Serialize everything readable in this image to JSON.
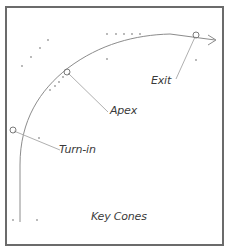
{
  "diagram": {
    "colors": {
      "border": "#6b6b6b",
      "line": "#8c8c8c",
      "leader": "#b0b0b0",
      "cone": "#9a9a9a",
      "text": "#3a3a3a"
    },
    "labels": {
      "turn_in": "Turn-in",
      "apex": "Apex",
      "exit": "Exit",
      "key_cones": "Key Cones"
    },
    "markers": [
      {
        "id": "turn_in",
        "x": 13,
        "y": 130
      },
      {
        "id": "apex",
        "x": 67,
        "y": 72
      },
      {
        "id": "exit",
        "x": 196,
        "y": 35
      }
    ],
    "cones": [
      {
        "x": 22,
        "y": 66
      },
      {
        "x": 31,
        "y": 57
      },
      {
        "x": 40,
        "y": 48
      },
      {
        "x": 48,
        "y": 40
      },
      {
        "x": 107,
        "y": 34
      },
      {
        "x": 116,
        "y": 34
      },
      {
        "x": 124,
        "y": 34
      },
      {
        "x": 132,
        "y": 34
      },
      {
        "x": 140,
        "y": 34
      },
      {
        "x": 107,
        "y": 59
      },
      {
        "x": 196,
        "y": 60
      },
      {
        "x": 50,
        "y": 90
      },
      {
        "x": 55,
        "y": 86
      },
      {
        "x": 59,
        "y": 82
      },
      {
        "x": 63,
        "y": 77
      },
      {
        "x": 39,
        "y": 138
      },
      {
        "x": 13,
        "y": 220
      },
      {
        "x": 37,
        "y": 220
      }
    ]
  }
}
